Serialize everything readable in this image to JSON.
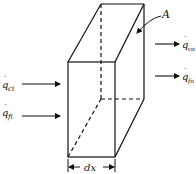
{
  "diagram": {
    "type": "control-volume-element",
    "labels": {
      "area": "A",
      "width": "dx",
      "inputs": [
        {
          "symbol": "q",
          "subscript": "ci"
        },
        {
          "symbol": "q",
          "subscript": "fi"
        }
      ],
      "outputs": [
        {
          "symbol": "q",
          "subscript": "co"
        },
        {
          "symbol": "q",
          "subscript": "fo"
        }
      ]
    },
    "colors": {
      "stroke": "#111111",
      "background": "#ffffff"
    }
  }
}
